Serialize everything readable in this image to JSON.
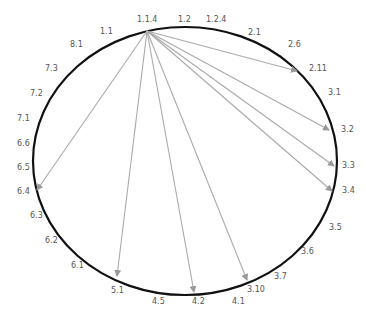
{
  "diagram": {
    "ellipse": {
      "cx": 185,
      "cy": 161,
      "rx": 152,
      "ry": 134,
      "stroke": "#111111",
      "stroke_width": 2.2
    },
    "source": {
      "id": "1.1.4",
      "x": 147,
      "y": 31
    },
    "edge_color": "#aaaaaa",
    "labels": [
      {
        "id": "l-1.1",
        "text": "1.1",
        "x": 100,
        "y": 34
      },
      {
        "id": "l-1.1.4",
        "text": "1.1.4",
        "x": 137,
        "y": 22
      },
      {
        "id": "l-1.2",
        "text": "1.2",
        "x": 178,
        "y": 22
      },
      {
        "id": "l-1.2.4",
        "text": "1.2.4",
        "x": 206,
        "y": 22
      },
      {
        "id": "l-2.1",
        "text": "2.1",
        "x": 248,
        "y": 35
      },
      {
        "id": "l-2.6",
        "text": "2.6",
        "x": 288,
        "y": 47
      },
      {
        "id": "l-2.11",
        "text": "2.11",
        "x": 309,
        "y": 71
      },
      {
        "id": "l-3.1",
        "text": "3.1",
        "x": 328,
        "y": 95
      },
      {
        "id": "l-3.2",
        "text": "3.2",
        "x": 341,
        "y": 132
      },
      {
        "id": "l-3.3",
        "text": "3.3",
        "x": 342,
        "y": 168
      },
      {
        "id": "l-3.4",
        "text": "3.4",
        "x": 342,
        "y": 193
      },
      {
        "id": "l-3.5",
        "text": "3.5",
        "x": 329,
        "y": 230
      },
      {
        "id": "l-3.6",
        "text": "3.6",
        "x": 301,
        "y": 254
      },
      {
        "id": "l-3.7",
        "text": "3.7",
        "x": 274,
        "y": 279
      },
      {
        "id": "l-3.10",
        "text": "3.10",
        "x": 247,
        "y": 292
      },
      {
        "id": "l-4.1",
        "text": "4.1",
        "x": 232,
        "y": 304
      },
      {
        "id": "l-4.2",
        "text": "4.2",
        "x": 192,
        "y": 304
      },
      {
        "id": "l-4.5",
        "text": "4.5",
        "x": 152,
        "y": 304
      },
      {
        "id": "l-5.1",
        "text": "5.1",
        "x": 111,
        "y": 293
      },
      {
        "id": "l-6.1",
        "text": "6.1",
        "x": 71,
        "y": 268
      },
      {
        "id": "l-6.2",
        "text": "6.2",
        "x": 45,
        "y": 243
      },
      {
        "id": "l-6.3",
        "text": "6.3",
        "x": 30,
        "y": 218
      },
      {
        "id": "l-6.4",
        "text": "6.4",
        "x": 17,
        "y": 194
      },
      {
        "id": "l-6.5",
        "text": "6.5",
        "x": 17,
        "y": 170
      },
      {
        "id": "l-6.6",
        "text": "6.6",
        "x": 17,
        "y": 146
      },
      {
        "id": "l-7.1",
        "text": "7.1",
        "x": 17,
        "y": 121
      },
      {
        "id": "l-7.2",
        "text": "7.2",
        "x": 30,
        "y": 96
      },
      {
        "id": "l-7.3",
        "text": "7.3",
        "x": 45,
        "y": 71
      },
      {
        "id": "l-8.1",
        "text": "8.1",
        "x": 70,
        "y": 47
      }
    ],
    "edges": [
      {
        "from": "1.1.4",
        "to": "2.11",
        "x2": 297,
        "y2": 71
      },
      {
        "from": "1.1.4",
        "to": "3.2",
        "x2": 329,
        "y2": 130
      },
      {
        "from": "1.1.4",
        "to": "3.3",
        "x2": 334,
        "y2": 166
      },
      {
        "from": "1.1.4",
        "to": "3.4",
        "x2": 332,
        "y2": 191
      },
      {
        "from": "1.1.4",
        "to": "3.10",
        "x2": 247,
        "y2": 280
      },
      {
        "from": "1.1.4",
        "to": "4.2",
        "x2": 194,
        "y2": 292
      },
      {
        "from": "1.1.4",
        "to": "5.1",
        "x2": 117,
        "y2": 276
      },
      {
        "from": "1.1.4",
        "to": "6.4",
        "x2": 37,
        "y2": 190
      }
    ]
  }
}
